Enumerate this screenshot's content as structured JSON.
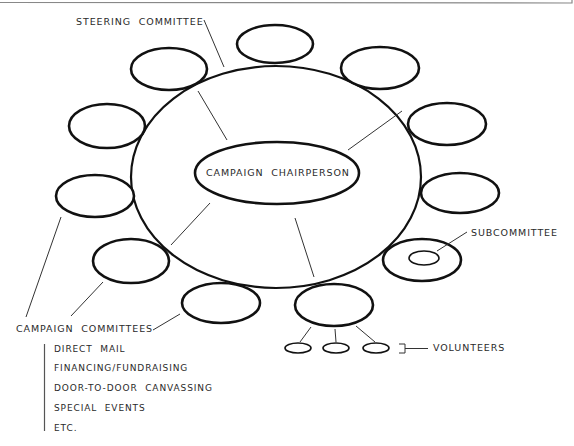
{
  "diagram": {
    "type": "organizational-structure",
    "center": {
      "label": "CAMPAIGN  CHAIRPERSON"
    },
    "steering_committee": {
      "label": "STEERING  COMMITTEE"
    },
    "campaign_committees": {
      "label": "CAMPAIGN  COMMITTEES",
      "examples": [
        "DIRECT  MAIL",
        "FINANCING/FUNDRAISING",
        "DOOR-TO-DOOR  CANVASSING",
        "SPECIAL  EVENTS",
        "ETC."
      ]
    },
    "subcommittee": {
      "label": "SUBCOMMITTEE"
    },
    "volunteers": {
      "label": "VOLUNTEERS",
      "count": 3
    },
    "committee_ellipse_count": 11,
    "colors": {
      "stroke": "#111111",
      "text": "#2a2a2a",
      "border": "#888888"
    }
  }
}
